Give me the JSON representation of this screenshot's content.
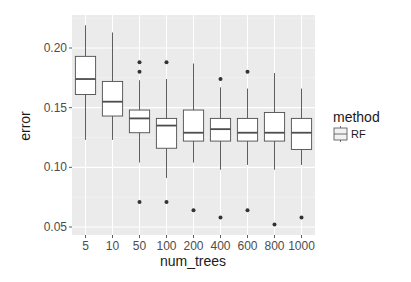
{
  "chart_data": {
    "type": "box",
    "title": "",
    "xlabel": "num_trees",
    "ylabel": "error",
    "ylim": [
      0.045,
      0.225
    ],
    "yticks": [
      0.05,
      0.1,
      0.15,
      0.2
    ],
    "ytick_labels": [
      "0.05",
      "0.10",
      "0.15",
      "0.20"
    ],
    "grid": true,
    "legend": {
      "title": "method",
      "entries": [
        "RF"
      ],
      "position": "right"
    },
    "categories": [
      "5",
      "10",
      "50",
      "100",
      "200",
      "400",
      "600",
      "800",
      "1000"
    ],
    "series": [
      {
        "name": "RF",
        "boxes": [
          {
            "category": "5",
            "whisker_low": 0.123,
            "q1": 0.161,
            "median": 0.174,
            "q3": 0.193,
            "whisker_high": 0.219,
            "outliers": []
          },
          {
            "category": "10",
            "whisker_low": 0.123,
            "q1": 0.143,
            "median": 0.155,
            "q3": 0.172,
            "whisker_high": 0.213,
            "outliers": []
          },
          {
            "category": "50",
            "whisker_low": 0.104,
            "q1": 0.129,
            "median": 0.141,
            "q3": 0.148,
            "whisker_high": 0.173,
            "outliers": [
              0.188,
              0.18,
              0.071
            ]
          },
          {
            "category": "100",
            "whisker_low": 0.091,
            "q1": 0.116,
            "median": 0.135,
            "q3": 0.141,
            "whisker_high": 0.174,
            "outliers": [
              0.188,
              0.071
            ]
          },
          {
            "category": "200",
            "whisker_low": 0.104,
            "q1": 0.122,
            "median": 0.129,
            "q3": 0.148,
            "whisker_high": 0.187,
            "outliers": [
              0.064
            ]
          },
          {
            "category": "400",
            "whisker_low": 0.098,
            "q1": 0.122,
            "median": 0.132,
            "q3": 0.141,
            "whisker_high": 0.167,
            "outliers": [
              0.174,
              0.058
            ]
          },
          {
            "category": "600",
            "whisker_low": 0.102,
            "q1": 0.122,
            "median": 0.129,
            "q3": 0.141,
            "whisker_high": 0.166,
            "outliers": [
              0.18,
              0.064
            ]
          },
          {
            "category": "800",
            "whisker_low": 0.098,
            "q1": 0.122,
            "median": 0.129,
            "q3": 0.146,
            "whisker_high": 0.179,
            "outliers": [
              0.052
            ]
          },
          {
            "category": "1000",
            "whisker_low": 0.102,
            "q1": 0.115,
            "median": 0.129,
            "q3": 0.141,
            "whisker_high": 0.166,
            "outliers": [
              0.058
            ]
          }
        ]
      }
    ]
  },
  "colors": {
    "panel_background": "#ebebeb",
    "grid_major": "#ffffff",
    "grid_minor": "#f5f5f5",
    "box_fill": "#ffffff",
    "box_stroke": "#4d4d4d",
    "outlier": "#333333"
  },
  "legend": {
    "title": "method",
    "label": "RF"
  },
  "axes": {
    "x_title": "num_trees",
    "y_title": "error"
  }
}
